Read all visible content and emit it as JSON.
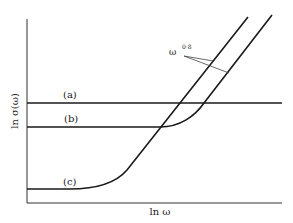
{
  "figure": {
    "y_axis_label": "ln σ(ω)",
    "x_axis_label": "ln ω",
    "annotation": {
      "base": "ω",
      "exponent": "0·8"
    },
    "curves": [
      {
        "id": "a",
        "label": "(a)",
        "description": "constant conductivity, horizontal line"
      },
      {
        "id": "b",
        "label": "(b)",
        "description": "flat then rising as ω^0·8"
      },
      {
        "id": "c",
        "label": "(c)",
        "description": "low flat plateau then rising as ω^0·8"
      }
    ],
    "colors": {
      "line": "#1a1a1a",
      "axis": "#333333",
      "background": "#ffffff"
    }
  }
}
